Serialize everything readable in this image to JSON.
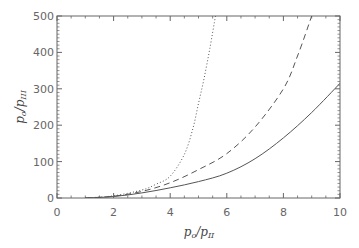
{
  "chart_data": {
    "type": "line",
    "title": "",
    "xlabel": "p_o/p_II",
    "ylabel": "p_o/p_III",
    "xlabel_main": "p",
    "xlabel_sub1": "o",
    "xlabel_sub2": "II",
    "ylabel_main": "p",
    "ylabel_sub1": "o",
    "ylabel_sub2": "III",
    "xlim": [
      0,
      10
    ],
    "ylim": [
      0,
      500
    ],
    "xticks": [
      "0",
      "2",
      "4",
      "6",
      "8",
      "10"
    ],
    "yticks": [
      "0",
      "100",
      "200",
      "300",
      "400",
      "500"
    ],
    "grid": false,
    "legend": "none",
    "series": [
      {
        "name": "solid",
        "style": "solid",
        "x": [
          1,
          2,
          3,
          4,
          5,
          6,
          7,
          8,
          9,
          10
        ],
        "y": [
          0,
          4,
          14,
          28,
          45,
          68,
          108,
          165,
          235,
          315
        ]
      },
      {
        "name": "dashed",
        "style": "dashed",
        "x": [
          1,
          2,
          3,
          4,
          5,
          6,
          7,
          8,
          8.5,
          9.0
        ],
        "y": [
          0,
          5,
          18,
          42,
          78,
          122,
          195,
          300,
          390,
          500
        ]
      },
      {
        "name": "dotted",
        "style": "dotted",
        "x": [
          1,
          2,
          3,
          3.5,
          4,
          4.5,
          4.8,
          5.0,
          5.2,
          5.4,
          5.6
        ],
        "y": [
          0,
          6,
          22,
          38,
          60,
          120,
          190,
          260,
          330,
          410,
          500
        ]
      }
    ],
    "colors": {
      "line": "#555555",
      "frame": "#666666",
      "text": "#666666"
    }
  }
}
